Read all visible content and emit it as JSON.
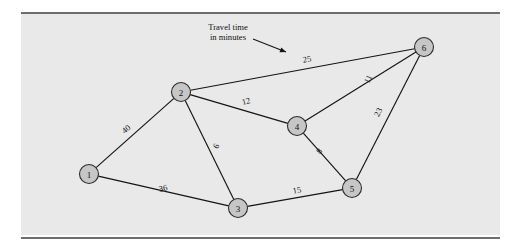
{
  "figure": {
    "background_color": "#e9e9e9",
    "rule_color": "#6d6d6d",
    "node_fill": "#c6c6c6",
    "node_stroke": "#2b2b2b",
    "edge_color": "#141414"
  },
  "annotation": {
    "line1": "Travel time",
    "line2": "in minutes",
    "points_to_label": "25"
  },
  "chart_data": {
    "type": "diagram",
    "subtype": "weighted-undirected-network",
    "title": "",
    "edge_weight_unit": "minutes",
    "nodes": [
      {
        "id": "1",
        "label": "1",
        "x": 89,
        "y": 174
      },
      {
        "id": "2",
        "label": "2",
        "x": 181,
        "y": 92
      },
      {
        "id": "3",
        "label": "3",
        "x": 238,
        "y": 208
      },
      {
        "id": "4",
        "label": "4",
        "x": 297,
        "y": 126
      },
      {
        "id": "5",
        "label": "5",
        "x": 352,
        "y": 188
      },
      {
        "id": "6",
        "label": "6",
        "x": 424,
        "y": 47
      }
    ],
    "node_radius": 9.5,
    "edges": [
      {
        "from": "1",
        "to": "2",
        "weight": 40,
        "label": "40",
        "lx": 126,
        "ly": 129,
        "rot": -41
      },
      {
        "from": "1",
        "to": "3",
        "weight": 36,
        "label": "36",
        "lx": 163,
        "ly": 188,
        "rot": -13
      },
      {
        "from": "2",
        "to": "3",
        "weight": 6,
        "label": "6",
        "lx": 216,
        "ly": 146,
        "rot": -64
      },
      {
        "from": "2",
        "to": "4",
        "weight": 12,
        "label": "12",
        "lx": 246,
        "ly": 101,
        "rot": -15
      },
      {
        "from": "2",
        "to": "6",
        "weight": 25,
        "label": "25",
        "lx": 307,
        "ly": 59,
        "rot": -10
      },
      {
        "from": "3",
        "to": "5",
        "weight": 15,
        "label": "15",
        "lx": 297,
        "ly": 190,
        "rot": -10
      },
      {
        "from": "4",
        "to": "5",
        "weight": 8,
        "label": "8",
        "lx": 319,
        "ly": 151,
        "rot": -50
      },
      {
        "from": "4",
        "to": "6",
        "weight": 11,
        "label": "11",
        "lx": 368,
        "ly": 79,
        "rot": -63
      },
      {
        "from": "5",
        "to": "6",
        "weight": 23,
        "label": "23",
        "lx": 378,
        "ly": 112,
        "rot": -64
      }
    ],
    "annotation_arrow": {
      "x1": 253,
      "y1": 39,
      "x2": 286,
      "y2": 52
    },
    "annotation_text_x": 228,
    "annotation_text_y": 30
  }
}
